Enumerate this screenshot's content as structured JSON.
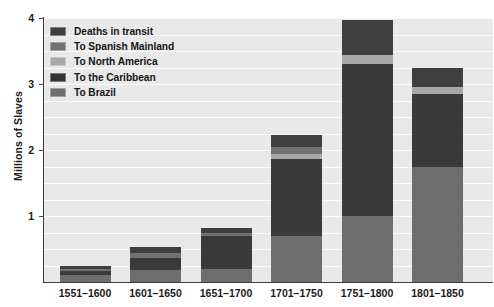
{
  "chart_data": {
    "type": "bar",
    "stacked": true,
    "title": "",
    "xlabel": "",
    "ylabel": "Millions of Slaves",
    "ylim": [
      0,
      4
    ],
    "y_ticks": [
      1,
      2,
      3,
      4
    ],
    "y_tick_labels": [
      "1",
      "2",
      "3",
      "4"
    ],
    "grid": true,
    "grid_interval": 0.25,
    "legend_position": "top-left inside plot",
    "categories": [
      "1551–1600",
      "1601–1650",
      "1651–1700",
      "1701–1750",
      "1751–1800",
      "1801–1850"
    ],
    "series": [
      {
        "name": "To Brazil",
        "color": "#6e6e6e",
        "values": [
          0.1,
          0.18,
          0.2,
          0.69,
          1.0,
          1.75
        ]
      },
      {
        "name": "To the Caribbean",
        "color": "#3a3a3a",
        "values": [
          0.06,
          0.19,
          0.5,
          1.17,
          2.31,
          1.1
        ]
      },
      {
        "name": "To North America",
        "color": "#a8a8a8",
        "values": [
          0.0,
          0.0,
          0.0,
          0.08,
          0.13,
          0.11
        ]
      },
      {
        "name": "To Spanish Mainland",
        "color": "#717171",
        "values": [
          0.03,
          0.07,
          0.04,
          0.1,
          0.0,
          0.0
        ]
      },
      {
        "name": "Deaths in transit",
        "color": "#3f3f3f",
        "values": [
          0.05,
          0.09,
          0.08,
          0.19,
          0.53,
          0.28
        ]
      }
    ],
    "totals": [
      0.24,
      0.53,
      0.82,
      2.23,
      3.97,
      3.24
    ]
  },
  "legend": {
    "items": [
      {
        "label": "Deaths in transit",
        "color": "#3f3f3f"
      },
      {
        "label": "To Spanish Mainland",
        "color": "#717171"
      },
      {
        "label": "To North America",
        "color": "#a8a8a8"
      },
      {
        "label": "To the Caribbean",
        "color": "#333333"
      },
      {
        "label": "To Brazil",
        "color": "#6e6e6e"
      }
    ]
  },
  "axes": {
    "y_title": "Millions of Slaves"
  },
  "style": {
    "plot_background": "#e9e9e9",
    "gridline_color": "#fafafa",
    "axis_color": "#3c3c3c",
    "text_color": "#1a1a1a"
  }
}
